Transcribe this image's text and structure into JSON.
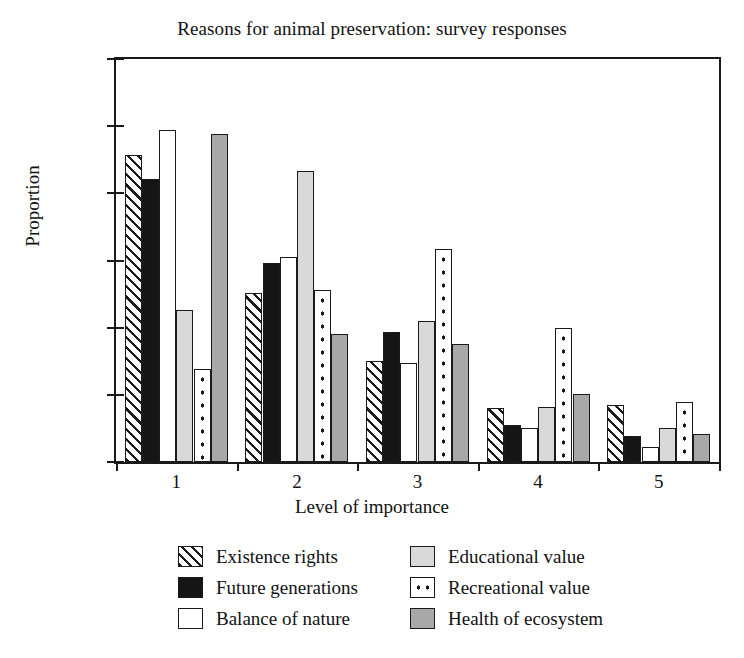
{
  "chart_data": {
    "type": "bar",
    "title": "Reasons for animal preservation: survey responses",
    "xlabel": "Level of importance",
    "ylabel": "Proportion",
    "categories": [
      "1",
      "2",
      "3",
      "4",
      "5"
    ],
    "ylim": [
      0,
      0.6
    ],
    "yticks": [
      0,
      0.1,
      0.2,
      0.3,
      0.4,
      0.5,
      0.6
    ],
    "ytick_labels": [
      "0",
      "0.1",
      "0.2",
      "0.3",
      "0.4",
      "0.5",
      "0.6"
    ],
    "grid": false,
    "legend_position": "below-center",
    "series": [
      {
        "name": "Existence rights",
        "pattern": "diagonal-hatch",
        "values": [
          0.457,
          0.252,
          0.151,
          0.08,
          0.085
        ]
      },
      {
        "name": "Future generations",
        "pattern": "solid-black",
        "values": [
          0.422,
          0.297,
          0.193,
          0.055,
          0.038
        ]
      },
      {
        "name": "Balance of nature",
        "pattern": "solid-white",
        "values": [
          0.494,
          0.305,
          0.148,
          0.05,
          0.023
        ]
      },
      {
        "name": "Educational value",
        "pattern": "light-gray",
        "values": [
          0.226,
          0.433,
          0.21,
          0.082,
          0.05
        ]
      },
      {
        "name": "Recreational value",
        "pattern": "dotted",
        "values": [
          0.138,
          0.256,
          0.317,
          0.2,
          0.089
        ]
      },
      {
        "name": "Health of ecosystem",
        "pattern": "medium-gray",
        "values": [
          0.489,
          0.19,
          0.175,
          0.101,
          0.042
        ]
      }
    ]
  },
  "legend": {
    "entries": [
      {
        "label": "Existence rights",
        "pattern": "diagonal-hatch"
      },
      {
        "label": "Educational value",
        "pattern": "light-gray"
      },
      {
        "label": "Future generations",
        "pattern": "solid-black"
      },
      {
        "label": "Recreational value",
        "pattern": "dotted"
      },
      {
        "label": "Balance of nature",
        "pattern": "solid-white"
      },
      {
        "label": "Health of ecosystem",
        "pattern": "medium-gray"
      }
    ]
  },
  "colors": {
    "axis": "#1a1a1a",
    "text": "#111111",
    "background": "#ffffff",
    "black_series": "#151515",
    "light_gray_series": "#d9d9d9",
    "medium_gray_series": "#a8a8a8"
  }
}
